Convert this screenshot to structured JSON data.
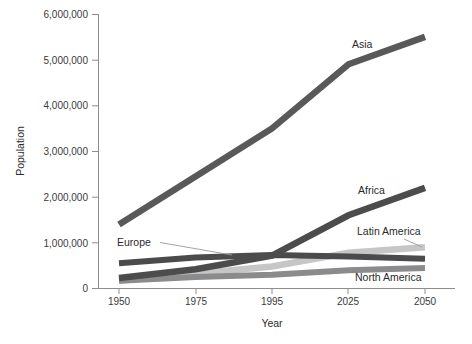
{
  "chart_data": {
    "type": "line",
    "title": "",
    "xlabel": "Year",
    "ylabel": "Population",
    "x": [
      1950,
      1975,
      1995,
      2025,
      2050
    ],
    "xtick_labels": [
      "1950",
      "1975",
      "1995",
      "2025",
      "2050"
    ],
    "ytick_labels": [
      "0",
      "1,000,000",
      "2,000,000",
      "3,000,000",
      "4,000,000",
      "5,000,000",
      "6,000,000"
    ],
    "ytick_values": [
      0,
      1000000,
      2000000,
      3000000,
      4000000,
      5000000,
      6000000
    ],
    "ylim": [
      0,
      6000000
    ],
    "xlim": [
      1950,
      2050
    ],
    "grid": false,
    "legend_position": "inline-labels",
    "series": [
      {
        "name": "Asia",
        "label": "Asia",
        "color": "#59595a",
        "values": [
          1400000,
          2450000,
          3500000,
          4900000,
          5500000
        ]
      },
      {
        "name": "Africa",
        "label": "Africa",
        "color": "#4c4c4d",
        "values": [
          230000,
          420000,
          720000,
          1600000,
          2200000
        ]
      },
      {
        "name": "Latin America",
        "label": "Latin America",
        "color": "#c6c6c6",
        "values": [
          170000,
          330000,
          480000,
          780000,
          900000
        ]
      },
      {
        "name": "Europe",
        "label": "Europe",
        "color": "#4b4b4d",
        "values": [
          550000,
          680000,
          730000,
          700000,
          650000
        ]
      },
      {
        "name": "North America",
        "label": "North America",
        "color": "#8b8b8d",
        "values": [
          170000,
          250000,
          300000,
          400000,
          450000
        ]
      }
    ],
    "annotations": [
      {
        "text": "Asia",
        "series": "Asia"
      },
      {
        "text": "Africa",
        "series": "Africa"
      },
      {
        "text": "Latin America",
        "series": "Latin America"
      },
      {
        "text": "Europe",
        "series": "Europe"
      },
      {
        "text": "North America",
        "series": "North America"
      }
    ]
  },
  "axis": {
    "x_title": "Year",
    "y_title": "Population"
  },
  "labels": {
    "asia": "Asia",
    "africa": "Africa",
    "latin_america": "Latin America",
    "europe": "Europe",
    "north_america": "North America"
  },
  "yticks": {
    "t0": "0",
    "t1": "1,000,000",
    "t2": "2,000,000",
    "t3": "3,000,000",
    "t4": "4,000,000",
    "t5": "5,000,000",
    "t6": "6,000,000"
  },
  "xticks": {
    "t0": "1950",
    "t1": "1975",
    "t2": "1995",
    "t3": "2025",
    "t4": "2050"
  }
}
